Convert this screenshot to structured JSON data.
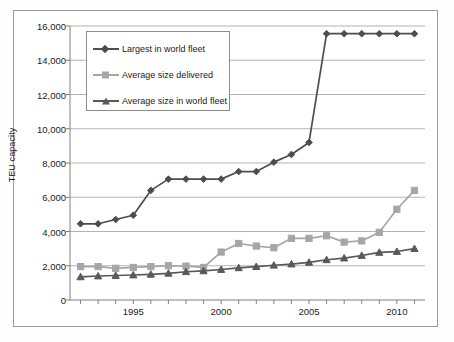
{
  "chart_data": {
    "type": "line",
    "title": "",
    "subtitle": "",
    "xlabel": "",
    "ylabel": "TEU capacity",
    "xlim": [
      1991.4,
      2011.6
    ],
    "ylim": [
      0,
      16000
    ],
    "grid": true,
    "grid_axis": "y",
    "legend_position": "upper-left-inside",
    "x": [
      1992,
      1993,
      1994,
      1995,
      1996,
      1997,
      1998,
      1999,
      2000,
      2001,
      2002,
      2003,
      2004,
      2005,
      2006,
      2007,
      2008,
      2009,
      2010,
      2011
    ],
    "xtick_labels": [
      "1995",
      "2000",
      "2005",
      "2010"
    ],
    "xtick_values": [
      1995,
      2000,
      2005,
      2010
    ],
    "ytick_labels": [
      "0",
      "2,000",
      "4,000",
      "6,000",
      "8,000",
      "10,000",
      "12,000",
      "14,000",
      "16,000"
    ],
    "ytick_values": [
      0,
      2000,
      4000,
      6000,
      8000,
      10000,
      12000,
      14000,
      16000
    ],
    "series": [
      {
        "name": "Largest in world fleet",
        "color": "#4d4d4d",
        "marker": "diamond",
        "values": [
          4450,
          4450,
          4700,
          4950,
          6400,
          7060,
          7060,
          7060,
          7060,
          7500,
          7500,
          8050,
          8500,
          9200,
          15550,
          15550,
          15550,
          15550,
          15550,
          15550
        ]
      },
      {
        "name": "Average size delivered",
        "color": "#a6a6a6",
        "marker": "square",
        "values": [
          1950,
          1950,
          1850,
          1900,
          1950,
          2000,
          1980,
          1900,
          2800,
          3300,
          3150,
          3050,
          3600,
          3600,
          3750,
          3380,
          3450,
          3950,
          5300,
          6400
        ]
      },
      {
        "name": "Average size in world fleet",
        "color": "#595959",
        "marker": "triangle",
        "values": [
          1350,
          1400,
          1430,
          1460,
          1500,
          1560,
          1650,
          1700,
          1780,
          1880,
          1950,
          2030,
          2100,
          2200,
          2350,
          2450,
          2600,
          2780,
          2830,
          3000
        ]
      }
    ]
  },
  "axis": {
    "y_title": "TEU capacity"
  },
  "legend": {
    "entries": [
      {
        "label": "Largest in world fleet"
      },
      {
        "label": "Average size delivered"
      },
      {
        "label": "Average size in world fleet"
      }
    ]
  },
  "style": {
    "frame_color": "#9a9a9a",
    "grid_color": "#b3b3b3",
    "axis_color": "#808080",
    "text_color": "#1a1a1a",
    "background": "#ffffff"
  }
}
